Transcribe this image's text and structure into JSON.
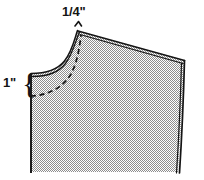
{
  "diagram": {
    "type": "sewing-pattern-schematic",
    "background_color": "#ffffff",
    "ink_color": "#141414",
    "fill_color": "#c9c9c9",
    "labels": {
      "seam_allowance": {
        "text": "1/4\"",
        "numerator": "1",
        "slash": "/",
        "denominator": "4",
        "unit": "\"",
        "points_to": "shoulder-point-apex"
      },
      "depth": {
        "text": "1\"",
        "value": "1",
        "unit": "\"",
        "bracket": "{",
        "points_to": "neckline-left-edge"
      }
    },
    "lines": {
      "cut_edge_style": "solid-double",
      "stitch_line_style": "dashed",
      "apex_marker": "caret-tick"
    }
  }
}
